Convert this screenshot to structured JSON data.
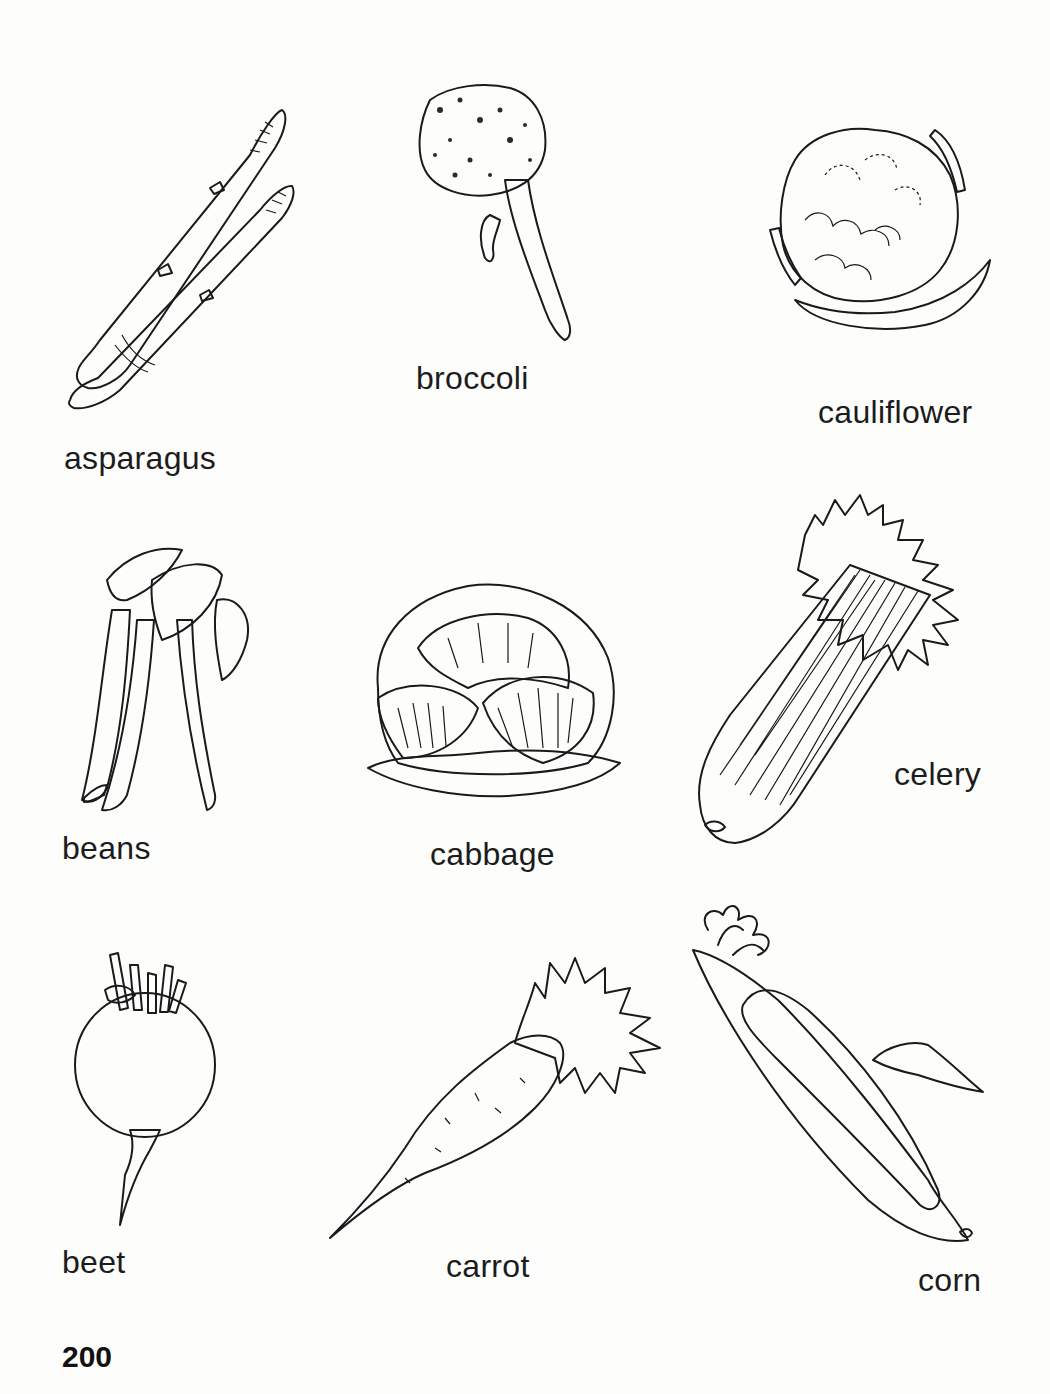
{
  "page": {
    "number": "200",
    "background": "#fdfdfc",
    "ink_color": "#1a1a1a"
  },
  "vegetables": [
    {
      "id": "asparagus",
      "label": "asparagus",
      "icon": "asparagus-illustration"
    },
    {
      "id": "broccoli",
      "label": "broccoli",
      "icon": "broccoli-illustration"
    },
    {
      "id": "cauliflower",
      "label": "cauliflower",
      "icon": "cauliflower-illustration"
    },
    {
      "id": "beans",
      "label": "beans",
      "icon": "beans-illustration"
    },
    {
      "id": "cabbage",
      "label": "cabbage",
      "icon": "cabbage-illustration"
    },
    {
      "id": "celery",
      "label": "celery",
      "icon": "celery-illustration"
    },
    {
      "id": "beet",
      "label": "beet",
      "icon": "beet-illustration"
    },
    {
      "id": "carrot",
      "label": "carrot",
      "icon": "carrot-illustration"
    },
    {
      "id": "corn",
      "label": "corn",
      "icon": "corn-illustration"
    }
  ]
}
